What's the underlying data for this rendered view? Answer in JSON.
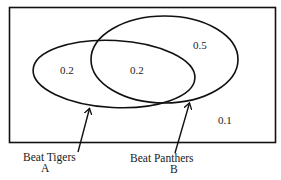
{
  "diagram": {
    "type": "venn",
    "universe": {
      "value": "0.1"
    },
    "sets": [
      {
        "id": "A",
        "name": "Beat Tigers",
        "letter": "A",
        "only_value": "0.2"
      },
      {
        "id": "B",
        "name": "Beat Panthers",
        "letter": "B",
        "only_value": "0.5"
      }
    ],
    "intersection": {
      "value": "0.2"
    },
    "colors": {
      "stroke": "#111111",
      "background": "#ffffff",
      "text": "#1a1a1a"
    }
  }
}
